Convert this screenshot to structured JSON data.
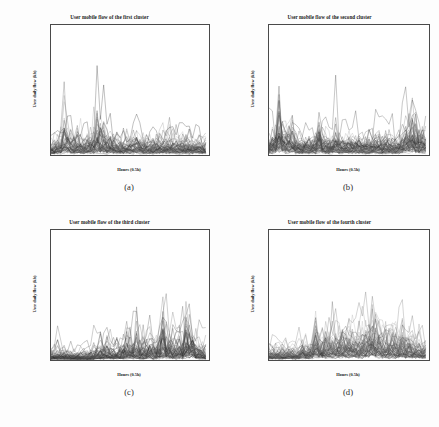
{
  "figure": {
    "caption": "",
    "background": "#fdfdfd"
  },
  "panels": [
    {
      "key": "a",
      "subcaption": "(a)",
      "title": "User mobile flow of the first cluster",
      "xlabel": "Hours (0.5h)",
      "ylabel": "User daily flow (kb)",
      "yticks": [
        "0",
        "100000",
        "200000",
        "300000",
        "400000",
        "500000"
      ],
      "ytick_values": [
        0,
        100000,
        200000,
        300000,
        400000,
        500000
      ],
      "xticks": [
        "0",
        "10",
        "20",
        "30",
        "40"
      ],
      "xtick_values": [
        0,
        10,
        20,
        30,
        40
      ]
    },
    {
      "key": "b",
      "subcaption": "(b)",
      "title": "User mobile flow of the second cluster",
      "xlabel": "Hours (0.5h)",
      "ylabel": "User daily flow (kb)",
      "yticks": [
        "0",
        "200000",
        "400000",
        "600000",
        "800000"
      ],
      "ytick_values": [
        0,
        200000,
        400000,
        600000,
        800000
      ],
      "xticks": [
        "0",
        "10",
        "20",
        "30",
        "40"
      ],
      "xtick_values": [
        0,
        10,
        20,
        30,
        40
      ]
    },
    {
      "key": "c",
      "subcaption": "(c)",
      "title": "User mobile flow of the third cluster",
      "xlabel": "Hours (0.5h)",
      "ylabel": "User daily flow (kb)",
      "yticks": [
        "0",
        "250000",
        "500000",
        "750000",
        "1000000",
        "1250000",
        "1500000"
      ],
      "ytick_values": [
        0,
        250000,
        500000,
        750000,
        1000000,
        1250000,
        1500000
      ],
      "xticks": [
        "0",
        "10",
        "20",
        "30",
        "40"
      ],
      "xtick_values": [
        0,
        10,
        20,
        30,
        40
      ]
    },
    {
      "key": "d",
      "subcaption": "(d)",
      "title": "User mobile flow of the fourth cluster",
      "xlabel": "Hours (0.5h)",
      "ylabel": "User daily flow (kb)",
      "yticks": [
        "0",
        "100000",
        "200000",
        "300000",
        "400000",
        "500000",
        "600000",
        "700000"
      ],
      "ytick_values": [
        0,
        100000,
        200000,
        300000,
        400000,
        500000,
        600000,
        700000
      ],
      "xticks": [
        "0",
        "10",
        "20",
        "30",
        "40"
      ],
      "xtick_values": [
        0,
        10,
        20,
        30,
        40
      ]
    }
  ],
  "chart_data": [
    {
      "type": "line",
      "title": "User mobile flow of the first cluster",
      "xlabel": "Hours (0.5h)",
      "ylabel": "User daily flow (kb)",
      "xlim": [
        0,
        48
      ],
      "ylim": [
        0,
        560000
      ],
      "grid": false,
      "legend": null,
      "n_series": 60,
      "series_note": "Many overlapping grey user traces, 48 half-hour samples each.",
      "x": [
        0,
        1,
        2,
        3,
        4,
        5,
        6,
        7,
        8,
        9,
        10,
        11,
        12,
        13,
        14,
        15,
        16,
        17,
        18,
        19,
        20,
        21,
        22,
        23,
        24,
        25,
        26,
        27,
        28,
        29,
        30,
        31,
        32,
        33,
        34,
        35,
        36,
        37,
        38,
        39,
        40,
        41,
        42,
        43,
        44,
        45,
        46,
        47
      ],
      "envelope_max": [
        160000,
        175000,
        200000,
        230000,
        560000,
        300000,
        255000,
        240000,
        250000,
        215000,
        200000,
        210000,
        230000,
        260000,
        540000,
        350000,
        340000,
        245000,
        230000,
        215000,
        200000,
        195000,
        200000,
        205000,
        210000,
        200000,
        290000,
        225000,
        200000,
        195000,
        190000,
        200000,
        210000,
        205000,
        200000,
        215000,
        260000,
        210000,
        200000,
        195000,
        190000,
        200000,
        195000,
        190000,
        185000,
        180000,
        180000,
        175000
      ],
      "envelope_typ": [
        55000,
        60000,
        70000,
        80000,
        120000,
        95000,
        90000,
        85000,
        88000,
        80000,
        75000,
        78000,
        82000,
        90000,
        110000,
        100000,
        98000,
        85000,
        80000,
        78000,
        75000,
        74000,
        76000,
        78000,
        80000,
        76000,
        92000,
        80000,
        76000,
        74000,
        73000,
        76000,
        78000,
        77000,
        76000,
        79000,
        86000,
        78000,
        75000,
        74000,
        72000,
        75000,
        74000,
        72000,
        70000,
        68000,
        68000,
        66000
      ]
    },
    {
      "type": "line",
      "title": "User mobile flow of the second cluster",
      "xlabel": "Hours (0.5h)",
      "ylabel": "User daily flow (kb)",
      "xlim": [
        0,
        48
      ],
      "ylim": [
        0,
        880000
      ],
      "grid": false,
      "legend": null,
      "n_series": 60,
      "series_note": "Dense overlapping grey traces; tall early peak near hour 3 and late peaks near hour 43.",
      "x": [
        0,
        1,
        2,
        3,
        4,
        5,
        6,
        7,
        8,
        9,
        10,
        11,
        12,
        13,
        14,
        15,
        16,
        17,
        18,
        19,
        20,
        21,
        22,
        23,
        24,
        25,
        26,
        27,
        28,
        29,
        30,
        31,
        32,
        33,
        34,
        35,
        36,
        37,
        38,
        39,
        40,
        41,
        42,
        43,
        44,
        45,
        46,
        47
      ],
      "envelope_max": [
        300000,
        420000,
        560000,
        860000,
        620000,
        520000,
        470000,
        530000,
        380000,
        360000,
        330000,
        350000,
        330000,
        320000,
        340000,
        660000,
        420000,
        380000,
        350000,
        340000,
        520000,
        360000,
        340000,
        330000,
        320000,
        330000,
        340000,
        350000,
        330000,
        320000,
        340000,
        360000,
        340000,
        330000,
        320000,
        460000,
        340000,
        330000,
        320000,
        330000,
        420000,
        560000,
        600000,
        780000,
        600000,
        520000,
        480000,
        440000
      ],
      "envelope_typ": [
        110000,
        140000,
        170000,
        230000,
        190000,
        170000,
        160000,
        175000,
        140000,
        135000,
        125000,
        130000,
        125000,
        122000,
        128000,
        190000,
        145000,
        135000,
        128000,
        125000,
        165000,
        130000,
        126000,
        124000,
        120000,
        124000,
        128000,
        130000,
        124000,
        120000,
        128000,
        132000,
        128000,
        124000,
        120000,
        150000,
        126000,
        124000,
        120000,
        124000,
        145000,
        175000,
        185000,
        230000,
        190000,
        170000,
        160000,
        150000
      ]
    },
    {
      "type": "line",
      "title": "User mobile flow of the third cluster",
      "xlabel": "Hours (0.5h)",
      "ylabel": "User daily flow (kb)",
      "xlim": [
        0,
        48
      ],
      "ylim": [
        0,
        1650000
      ],
      "grid": false,
      "legend": null,
      "n_series": 60,
      "series_note": "Low activity in early hours, rising mid-day, tallest spike ~1600000 near hour 34 and a broad plateau ~1280000 near hour 42.",
      "x": [
        0,
        1,
        2,
        3,
        4,
        5,
        6,
        7,
        8,
        9,
        10,
        11,
        12,
        13,
        14,
        15,
        16,
        17,
        18,
        19,
        20,
        21,
        22,
        23,
        24,
        25,
        26,
        27,
        28,
        29,
        30,
        31,
        32,
        33,
        34,
        35,
        36,
        37,
        38,
        39,
        40,
        41,
        42,
        43,
        44,
        45,
        46,
        47
      ],
      "envelope_max": [
        300000,
        330000,
        360000,
        340000,
        320000,
        300000,
        290000,
        280000,
        270000,
        260000,
        280000,
        300000,
        330000,
        360000,
        560000,
        520000,
        480000,
        600000,
        520000,
        460000,
        480000,
        520000,
        640000,
        1020000,
        760000,
        700000,
        1000000,
        720000,
        660000,
        700000,
        760000,
        720000,
        700000,
        900000,
        1600000,
        1020000,
        880000,
        760000,
        700000,
        900000,
        760000,
        1280000,
        1280000,
        1280000,
        700000,
        620000,
        580000,
        540000
      ],
      "envelope_typ": [
        95000,
        100000,
        108000,
        104000,
        100000,
        94000,
        92000,
        88000,
        86000,
        84000,
        88000,
        94000,
        100000,
        108000,
        160000,
        150000,
        140000,
        170000,
        150000,
        135000,
        140000,
        150000,
        180000,
        260000,
        205000,
        190000,
        255000,
        195000,
        180000,
        190000,
        205000,
        195000,
        190000,
        235000,
        380000,
        260000,
        230000,
        205000,
        190000,
        235000,
        205000,
        310000,
        310000,
        310000,
        190000,
        170000,
        160000,
        150000
      ]
    },
    {
      "type": "line",
      "title": "User mobile flow of the fourth cluster",
      "xlabel": "Hours (0.5h)",
      "ylabel": "User daily flow (kb)",
      "xlim": [
        0,
        48
      ],
      "ylim": [
        0,
        760000
      ],
      "grid": false,
      "legend": null,
      "n_series": 60,
      "series_note": "Dense mid-day band; highest spike ~720000 near hour 31 and another ~580000 near hour 14.",
      "x": [
        0,
        1,
        2,
        3,
        4,
        5,
        6,
        7,
        8,
        9,
        10,
        11,
        12,
        13,
        14,
        15,
        16,
        17,
        18,
        19,
        20,
        21,
        22,
        23,
        24,
        25,
        26,
        27,
        28,
        29,
        30,
        31,
        32,
        33,
        34,
        35,
        36,
        37,
        38,
        39,
        40,
        41,
        42,
        43,
        44,
        45,
        46,
        47
      ],
      "envelope_max": [
        190000,
        210000,
        200000,
        195000,
        190000,
        200000,
        210000,
        195000,
        190000,
        200000,
        300000,
        260000,
        240000,
        300000,
        580000,
        380000,
        420000,
        430000,
        400000,
        450000,
        420000,
        480000,
        470000,
        500000,
        480000,
        450000,
        440000,
        480000,
        470000,
        500000,
        600000,
        720000,
        520000,
        480000,
        450000,
        440000,
        430000,
        420000,
        460000,
        420000,
        540000,
        430000,
        400000,
        380000,
        360000,
        340000,
        320000,
        300000
      ],
      "envelope_typ": [
        68000,
        74000,
        72000,
        70000,
        68000,
        72000,
        75000,
        70000,
        68000,
        72000,
        105000,
        92000,
        85000,
        105000,
        190000,
        130000,
        145000,
        148000,
        138000,
        155000,
        145000,
        165000,
        162000,
        172000,
        165000,
        155000,
        152000,
        165000,
        162000,
        172000,
        200000,
        235000,
        178000,
        165000,
        155000,
        152000,
        148000,
        145000,
        158000,
        145000,
        182000,
        148000,
        138000,
        130000,
        124000,
        118000,
        112000,
        105000
      ]
    }
  ]
}
